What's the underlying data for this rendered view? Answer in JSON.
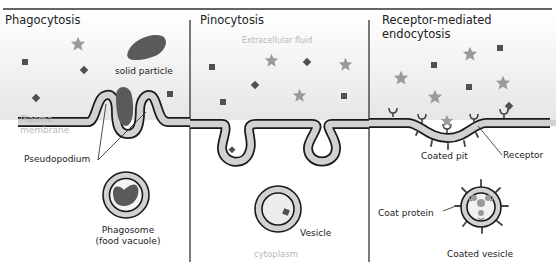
{
  "header": {
    "title": "Endocytosis"
  },
  "panels": [
    {
      "id": "phagocytosis",
      "title": "Phagocytosis",
      "labels": {
        "solid_particle": "solid particle",
        "plasma_membrane_1": "Plasma",
        "plasma_membrane_2": "membrane",
        "pseudopodium": "Pseudopodium",
        "phagosome_1": "Phagosome",
        "phagosome_2": "(food vacuole)"
      }
    },
    {
      "id": "pinocytosis",
      "title": "Pinocytosis",
      "labels": {
        "extracellular_fluid": "Extracellular fluid",
        "vesicle": "Vesicle",
        "cytoplasm": "cytoplasm"
      }
    },
    {
      "id": "receptor-mediated",
      "title_line1": "Receptor-mediated",
      "title_line2": "endocytosis",
      "labels": {
        "coated_pit": "Coated pit",
        "receptor": "Receptor",
        "coat_protein": "Coat protein",
        "coated_vesicle": "Coated vesicle"
      }
    }
  ],
  "colors": {
    "membrane_fill": "#d2d2d2",
    "membrane_stroke": "#1a1a1a",
    "particle_dark": "#555555",
    "star": "#9a9a9a",
    "square": "#505050",
    "faint_text": "#b8b8b8"
  }
}
